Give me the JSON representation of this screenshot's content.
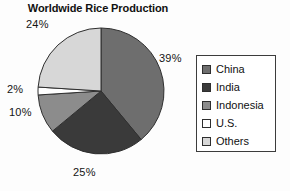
{
  "chart_data": {
    "type": "pie",
    "title": "Worldwide Rice Production",
    "categories": [
      "China",
      "India",
      "Indonesia",
      "U.S.",
      "Others"
    ],
    "values": [
      39,
      25,
      10,
      2,
      24
    ],
    "value_labels": [
      "39%",
      "25%",
      "10%",
      "2%",
      "24%"
    ],
    "unit": "%",
    "colors": [
      "#6e6e6e",
      "#3a3a3a",
      "#8c8c8c",
      "#ffffff",
      "#d7d7d7"
    ],
    "legend_position": "right",
    "grid": false,
    "start_angle_deg": 0,
    "direction": "clockwise",
    "xlabel": "",
    "ylabel": ""
  },
  "legend": {
    "items": [
      {
        "label": "China",
        "color": "#6e6e6e"
      },
      {
        "label": "India",
        "color": "#3a3a3a"
      },
      {
        "label": "Indonesia",
        "color": "#8c8c8c"
      },
      {
        "label": "U.S.",
        "color": "#ffffff"
      },
      {
        "label": "Others",
        "color": "#d7d7d7"
      }
    ]
  }
}
